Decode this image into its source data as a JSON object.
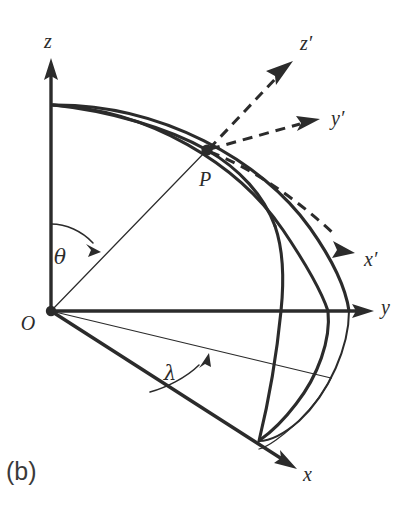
{
  "figure": {
    "panel_label": "(b)",
    "background_color": "#ffffff",
    "ink_color": "#2b2b2b"
  },
  "axes": [
    {
      "id": "z",
      "label": "z",
      "kind": "solid",
      "label_x": 48,
      "label_y": 48
    },
    {
      "id": "y",
      "label": "y",
      "kind": "solid",
      "label_x": 381,
      "label_y": 314
    },
    {
      "id": "x",
      "label": "x",
      "kind": "solid",
      "label_x": 303,
      "label_y": 481
    },
    {
      "id": "zp",
      "label": "z′",
      "kind": "dashed",
      "label_x": 300,
      "label_y": 50
    },
    {
      "id": "yp",
      "label": "y′",
      "kind": "dashed",
      "label_x": 331,
      "label_y": 125
    },
    {
      "id": "xp",
      "label": "x′",
      "kind": "dashed",
      "label_x": 364,
      "label_y": 266
    }
  ],
  "points": [
    {
      "id": "O",
      "label": "O",
      "x": 51,
      "y": 311,
      "label_x": 28,
      "label_y": 330
    },
    {
      "id": "P",
      "label": "P",
      "x": 207,
      "y": 150,
      "label_x": 205,
      "label_y": 186
    }
  ],
  "angles": [
    {
      "id": "theta",
      "label": "θ",
      "label_x": 60,
      "label_y": 264,
      "between": "z-axis and OP"
    },
    {
      "id": "lambda",
      "label": "λ",
      "label_x": 170,
      "label_y": 380,
      "between": "x-axis and equatorial projection of OP"
    }
  ]
}
